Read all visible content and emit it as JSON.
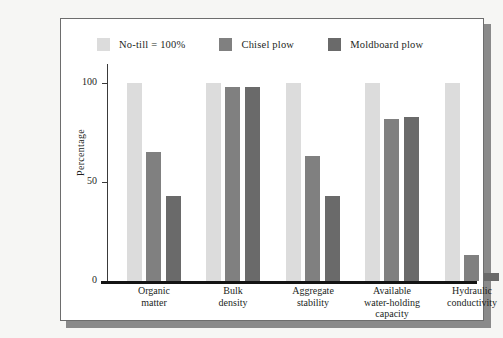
{
  "chart_data": {
    "type": "bar",
    "title": "",
    "xlabel": "",
    "ylabel": "Percentage",
    "ylim": [
      0,
      110
    ],
    "yticks": [
      0,
      50,
      100
    ],
    "ytick_labels": [
      "0",
      "50",
      "100"
    ],
    "grid": false,
    "legend_position": "top",
    "categories": [
      "Organic\nmatter",
      "Bulk\ndensity",
      "Aggregate\nstability",
      "Available\nwater-holding\ncapacity",
      "Hydraulic\nconductivity"
    ],
    "category_lines": [
      [
        "Organic",
        "matter"
      ],
      [
        "Bulk",
        "density"
      ],
      [
        "Aggregate",
        "stability"
      ],
      [
        "Available",
        "water-holding",
        "capacity"
      ],
      [
        "Hydraulic",
        "conductivity"
      ]
    ],
    "series": [
      {
        "name": "No-till = 100%",
        "color": "#dcdcdc",
        "values": [
          100,
          100,
          100,
          100,
          100
        ]
      },
      {
        "name": "Chisel plow",
        "color": "#808080",
        "values": [
          65,
          98,
          63,
          82,
          13
        ]
      },
      {
        "name": "Moldboard plow",
        "color": "#6a6a6a",
        "values": [
          43,
          98,
          43,
          83,
          4
        ]
      }
    ]
  },
  "legend": {
    "entries": [
      {
        "label": "No-till = 100%",
        "color": "#dcdcdc"
      },
      {
        "label": "Chisel plow",
        "color": "#808080"
      },
      {
        "label": "Moldboard plow",
        "color": "#6a6a6a"
      }
    ]
  },
  "axes": {
    "y_title": "Percentage",
    "y_tick_0": "0",
    "y_tick_50": "50",
    "y_tick_100": "100"
  },
  "colors": {
    "page_background": "#f6f6f4",
    "panel_background": "#ffffff",
    "panel_border": "#6d6d6d",
    "panel_shadow": "#8a8a8a",
    "axis": "#3a3a3a",
    "baseline": "#141414",
    "text": "#231f1d"
  }
}
